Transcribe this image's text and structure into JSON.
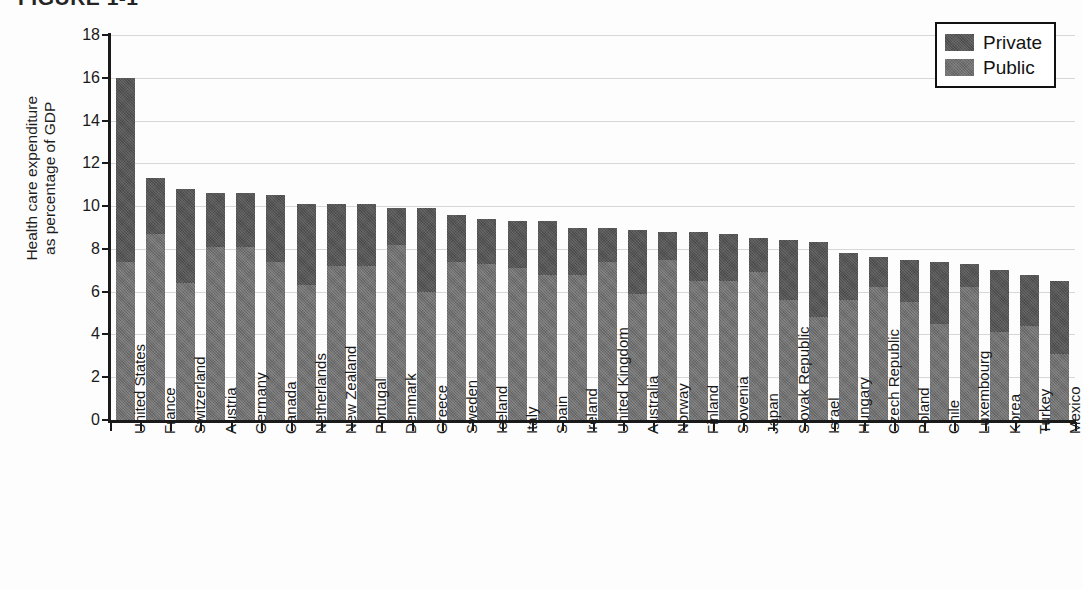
{
  "figure": {
    "caption": "FIGURE 1-1",
    "legend_title": ""
  },
  "legend": {
    "position": "top-right",
    "items": [
      {
        "label": "Private",
        "color": "#555555",
        "swatch_name": "legend-swatch-private"
      },
      {
        "label": "Public",
        "color": "#707070",
        "swatch_name": "legend-swatch-public"
      }
    ]
  },
  "axes": {
    "y_title": "Health care expenditure\nas percentage of GDP",
    "y_ticks": [
      "0",
      "2",
      "4",
      "6",
      "8",
      "10",
      "12",
      "14",
      "16",
      "18"
    ],
    "x_title": ""
  },
  "chart_data": {
    "type": "bar",
    "title": "FIGURE 1-1",
    "xlabel": "",
    "ylabel": "Health care expenditure as percentage of GDP",
    "ylim": [
      0,
      18
    ],
    "ytick_step": 2,
    "grid": true,
    "stacked": true,
    "legend_position": "top-right",
    "categories": [
      "United States",
      "France",
      "Switzerland",
      "Austria",
      "Germany",
      "Canada",
      "Netherlands",
      "New Zealand",
      "Portugal",
      "Denmark",
      "Greece",
      "Sweden",
      "Iceland",
      "Italy",
      "Spain",
      "Ireland",
      "United Kingdom",
      "Australia",
      "Norway",
      "Finland",
      "Slovenia",
      "Japan",
      "Slovak Republic",
      "Israel",
      "Hungary",
      "Czech Republic",
      "Poland",
      "Chile",
      "Luxembourg",
      "Korea",
      "Turkey",
      "Mexico"
    ],
    "series": [
      {
        "name": "Public",
        "color": "#707070",
        "values": [
          7.4,
          8.7,
          6.4,
          8.1,
          8.1,
          7.4,
          6.3,
          7.2,
          7.2,
          8.2,
          6.0,
          7.4,
          7.3,
          7.1,
          6.8,
          6.8,
          7.4,
          5.9,
          7.5,
          6.5,
          6.5,
          6.9,
          5.6,
          4.8,
          5.6,
          6.2,
          5.5,
          4.5,
          6.2,
          4.1,
          4.4,
          3.1
        ]
      },
      {
        "name": "Private",
        "color": "#555555",
        "values": [
          8.6,
          2.6,
          4.4,
          2.5,
          2.5,
          3.1,
          3.8,
          2.9,
          2.9,
          1.7,
          3.9,
          2.2,
          2.1,
          2.2,
          2.5,
          2.2,
          1.6,
          3.0,
          1.3,
          2.3,
          2.2,
          1.6,
          2.8,
          3.5,
          2.2,
          1.4,
          2.0,
          2.9,
          1.1,
          2.9,
          2.4,
          3.4
        ]
      }
    ],
    "totals": [
      16.0,
      11.3,
      10.8,
      10.6,
      10.6,
      10.5,
      10.1,
      10.1,
      10.1,
      9.9,
      9.9,
      9.6,
      9.4,
      9.3,
      9.3,
      9.0,
      9.0,
      8.9,
      8.8,
      8.8,
      8.7,
      8.5,
      8.4,
      8.3,
      7.8,
      7.6,
      7.5,
      7.4,
      7.3,
      7.0,
      6.8,
      6.5
    ]
  }
}
